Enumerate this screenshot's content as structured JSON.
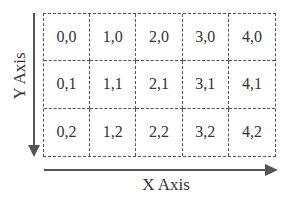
{
  "axes": {
    "x_label": "X Axis",
    "y_label": "Y Axis"
  },
  "grid": {
    "columns": 5,
    "rows": 3,
    "cells": [
      [
        "0,0",
        "1,0",
        "2,0",
        "3,0",
        "4,0"
      ],
      [
        "0,1",
        "1,1",
        "2,1",
        "3,1",
        "4,1"
      ],
      [
        "0,2",
        "1,2",
        "2,2",
        "3,2",
        "4,2"
      ]
    ]
  },
  "colors": {
    "line": "#555555",
    "text": "#333333",
    "background": "#ffffff"
  }
}
